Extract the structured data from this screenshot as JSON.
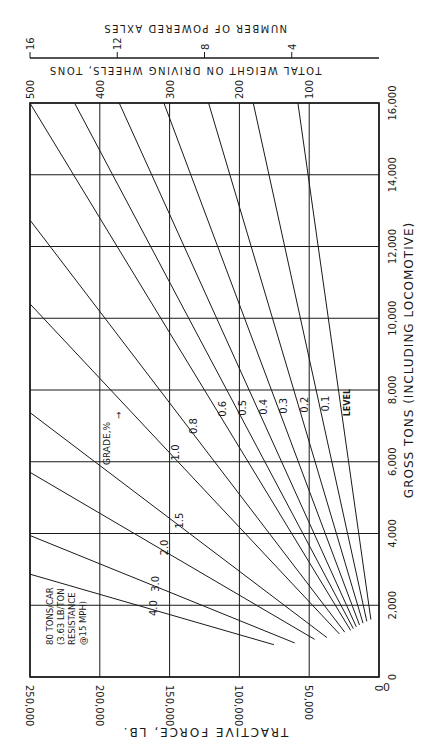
{
  "chart_data": {
    "type": "line",
    "orientation": "rotated 90° clockwise (x-axis runs vertically on the page, y-axis horizontally)",
    "title": "",
    "xlabel": "GROSS TONS (INCLUDING LOCOMOTIVE)",
    "ylabel": "TRACTIVE FORCE, LB.",
    "secondary_y_label": "TOTAL WEIGHT ON DRIVING WHEELS, TONS",
    "tertiary_y_label": "NUMBER OF POWERED AXLES",
    "xlim": [
      0,
      16000
    ],
    "ylim": [
      0,
      250000
    ],
    "x_ticks": [
      "0",
      "2,000",
      "4,000",
      "6,000",
      "8,000",
      "10,000",
      "12,000",
      "14,000",
      "16,000"
    ],
    "x_tick_values": [
      0,
      2000,
      4000,
      6000,
      8000,
      10000,
      12000,
      14000,
      16000
    ],
    "y_ticks": [
      "0",
      "50,000",
      "100,000",
      "150,000",
      "200,000",
      "250,000"
    ],
    "y_tick_values": [
      0,
      50000,
      100000,
      150000,
      200000,
      250000
    ],
    "secondary_ticks": [
      "100",
      "200",
      "300",
      "400",
      "500"
    ],
    "secondary_tick_values_lb": [
      50000,
      100000,
      150000,
      200000,
      250000
    ],
    "tertiary_ticks": [
      "4",
      "8",
      "12",
      "16"
    ],
    "tertiary_tick_values_lb": [
      62500,
      125000,
      187500,
      250000
    ],
    "grid": true,
    "legend_title": "GRADE, %",
    "annotation": [
      "80 TONS/CAR",
      "(3.63 LB/TON",
      "RESISTANCE",
      "@15 MPH)"
    ],
    "series": [
      {
        "name": "4.0",
        "label": "4.0",
        "x": [
          900,
          2866
        ],
        "y": [
          75267,
          250000
        ]
      },
      {
        "name": "3.0",
        "label": "3.0",
        "x": [
          950,
          3944
        ],
        "y": [
          60449,
          250000
        ]
      },
      {
        "name": "2.0",
        "label": "2.0",
        "x": [
          1050,
          5705
        ],
        "y": [
          46112,
          250000
        ]
      },
      {
        "name": "1.5",
        "label": "1.5",
        "x": [
          1100,
          7369
        ],
        "y": [
          37323,
          250000
        ]
      },
      {
        "name": "1.0",
        "label": "1.0",
        "x": [
          1200,
          10400
        ],
        "y": [
          28356,
          250000
        ]
      },
      {
        "name": "0.8",
        "label": "0.8",
        "x": [
          1250,
          12736
        ],
        "y": [
          24538,
          250000
        ]
      },
      {
        "name": "0.6",
        "label": "0.6",
        "x": [
          1300,
          16000
        ],
        "y": [
          20319,
          250080
        ]
      },
      {
        "name": "0.5",
        "label": "0.5",
        "x": [
          1350,
          16000
        ],
        "y": [
          18401,
          218080
        ]
      },
      {
        "name": "0.4",
        "label": "0.4",
        "x": [
          1400,
          16000
        ],
        "y": [
          16282,
          186080
        ]
      },
      {
        "name": "0.3",
        "label": "0.3",
        "x": [
          1450,
          16000
        ],
        "y": [
          13964,
          154080
        ]
      },
      {
        "name": "0.2",
        "label": "0.2",
        "x": [
          1500,
          16000
        ],
        "y": [
          11445,
          122080
        ]
      },
      {
        "name": "0.1",
        "label": "0.1",
        "x": [
          1550,
          16000
        ],
        "y": [
          8727,
          90080
        ]
      },
      {
        "name": "Level",
        "label": "LEVEL",
        "x": [
          1600,
          16000
        ],
        "y": [
          5808,
          58080
        ]
      }
    ]
  },
  "labels": {
    "xlabel": "GROSS TONS (INCLUDING LOCOMOTIVE)",
    "ylabel": "TRACTIVE FORCE, LB.",
    "secondary": "TOTAL WEIGHT ON DRIVING WHEELS, TONS",
    "tertiary": "NUMBER OF POWERED AXLES",
    "grade_title": "GRADE,%",
    "note1": "80 TONS/CAR",
    "note2": "(3.63 LB/TON",
    "note3": "RESISTANCE",
    "note4": "@15 MPH)",
    "origin": "0"
  },
  "colors": {
    "ink": "#1a1a1a",
    "paper": "#ffffff"
  }
}
